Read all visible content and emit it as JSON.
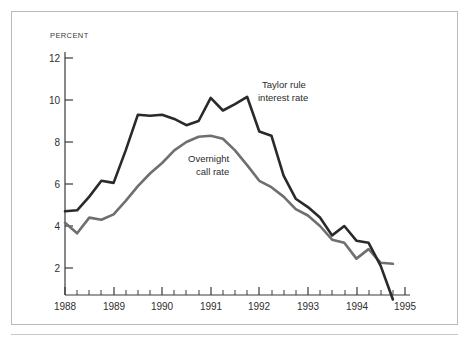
{
  "figure": {
    "background_color": "#ffffff",
    "frame_color": "#b9b9b9"
  },
  "axis": {
    "unit_label": "PERCENT",
    "y_ticks": [
      "12",
      "10",
      "8",
      "6",
      "4",
      "2"
    ],
    "x_ticks": [
      "1988",
      "1989",
      "1990",
      "1991",
      "1992",
      "1993",
      "1994",
      "1995"
    ]
  },
  "annotations": {
    "taylor_line1": "Taylor rule",
    "taylor_line2": "interest rate",
    "overnight_line1": "Overnight",
    "overnight_line2": "call rate"
  },
  "chart_data": {
    "type": "line",
    "title": "",
    "subtitle": "",
    "xlabel": "",
    "ylabel": "PERCENT",
    "xlim": [
      1988.0,
      1995.0
    ],
    "ylim": [
      0,
      12.6
    ],
    "grid": false,
    "legend_position": "inline-annotation",
    "x_tick_values": [
      1988,
      1989,
      1990,
      1991,
      1992,
      1993,
      1994,
      1995
    ],
    "x_tick_labels": [
      "1988",
      "1989",
      "1990",
      "1991",
      "1992",
      "1993",
      "1994",
      "1995"
    ],
    "x_minor_tick_interval": 0.25,
    "y_tick_values": [
      2,
      4,
      6,
      8,
      10,
      12
    ],
    "y_tick_labels": [
      "2",
      "4",
      "6",
      "8",
      "10",
      "12"
    ],
    "series": [
      {
        "name": "Taylor rule interest rate",
        "color": "#2a2a2a",
        "line_width": 2.6,
        "x": [
          1988.0,
          1988.25,
          1988.5,
          1988.75,
          1989.0,
          1989.25,
          1989.5,
          1989.75,
          1990.0,
          1990.25,
          1990.5,
          1990.75,
          1991.0,
          1991.25,
          1991.5,
          1991.75,
          1992.0,
          1992.25,
          1992.5,
          1992.75,
          1993.0,
          1993.25,
          1993.5,
          1993.75,
          1994.0,
          1994.25,
          1994.5,
          1994.75
        ],
        "values": [
          4.7,
          4.75,
          5.4,
          6.15,
          6.05,
          7.6,
          9.3,
          9.25,
          9.3,
          9.1,
          8.8,
          9.0,
          10.1,
          9.5,
          9.8,
          10.15,
          8.5,
          8.3,
          6.4,
          5.3,
          4.9,
          4.4,
          3.55,
          4.0,
          3.3,
          3.2,
          2.1,
          0.5
        ]
      },
      {
        "name": "Overnight call rate",
        "color": "#6f6f6f",
        "line_width": 2.6,
        "x": [
          1988.0,
          1988.25,
          1988.5,
          1988.75,
          1989.0,
          1989.25,
          1989.5,
          1989.75,
          1990.0,
          1990.25,
          1990.5,
          1990.75,
          1991.0,
          1991.25,
          1991.5,
          1991.75,
          1992.0,
          1992.25,
          1992.5,
          1992.75,
          1993.0,
          1993.25,
          1993.5,
          1993.75,
          1994.0,
          1994.25,
          1994.5,
          1994.75
        ],
        "values": [
          4.15,
          3.65,
          4.4,
          4.3,
          4.55,
          5.2,
          5.9,
          6.5,
          7.0,
          7.6,
          8.0,
          8.25,
          8.3,
          8.15,
          7.6,
          6.9,
          6.15,
          5.85,
          5.4,
          4.8,
          4.5,
          4.0,
          3.35,
          3.2,
          2.45,
          2.9,
          2.25,
          2.2
        ]
      }
    ]
  }
}
